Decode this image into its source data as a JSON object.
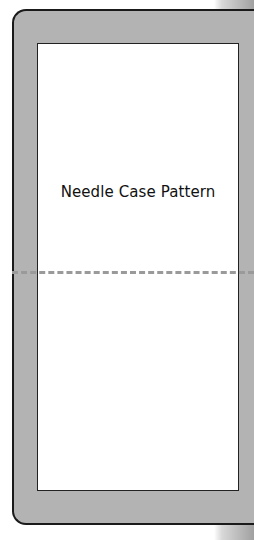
{
  "pattern": {
    "title": "Needle Case Pattern",
    "fold_line": "dashed",
    "colors": {
      "border_fill": "#b3b3b3",
      "outline": "#1a1a1a",
      "inner_fill": "#ffffff",
      "fold_line": "#9a9a9a"
    }
  }
}
